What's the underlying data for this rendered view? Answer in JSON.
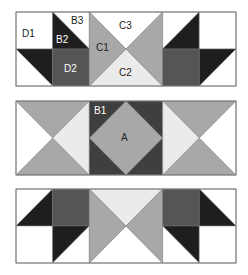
{
  "colors": {
    "white": "#ffffff",
    "black": "#1e1e1e",
    "dark": "#3f3f3f",
    "darkgray": "#555555",
    "mid": "#a8a8a8",
    "light": "#ebebeb",
    "stroke": "#777777"
  },
  "layout": {
    "strip_x": 16,
    "strip_width": 220,
    "strip_height": 74,
    "block_width": 73.33
  },
  "strips": [
    {
      "name": "top-strip",
      "y": 12,
      "blocks": [
        {
          "type": "cells",
          "cells": [
            {
              "pos": "tl",
              "kind": "solid",
              "fill": "white"
            },
            {
              "pos": "tr",
              "kind": "split-tlbr",
              "upper": "white",
              "lower": "black"
            },
            {
              "pos": "bl",
              "kind": "split-tlbr",
              "upper": "black",
              "lower": "white"
            },
            {
              "pos": "br",
              "kind": "solid",
              "fill": "darkgray"
            }
          ]
        },
        {
          "type": "hourglass",
          "top": "white",
          "bottom": "light",
          "left": "mid",
          "right": "mid"
        },
        {
          "type": "cells",
          "cells": [
            {
              "pos": "tl",
              "kind": "split-bltr",
              "upper": "white",
              "lower": "black"
            },
            {
              "pos": "tr",
              "kind": "solid",
              "fill": "white"
            },
            {
              "pos": "bl",
              "kind": "solid",
              "fill": "darkgray"
            },
            {
              "pos": "br",
              "kind": "split-bltr",
              "upper": "black",
              "lower": "white"
            }
          ]
        }
      ]
    },
    {
      "name": "middle-strip",
      "y": 101,
      "blocks": [
        {
          "type": "hourglass",
          "top": "mid",
          "bottom": "mid",
          "left": "white",
          "right": "light"
        },
        {
          "type": "diamond",
          "background": "dark",
          "diamond": "mid"
        },
        {
          "type": "hourglass",
          "top": "mid",
          "bottom": "mid",
          "left": "light",
          "right": "white"
        }
      ]
    },
    {
      "name": "bottom-strip",
      "y": 189,
      "blocks": [
        {
          "type": "cells",
          "cells": [
            {
              "pos": "tl",
              "kind": "split-bltr",
              "upper": "white",
              "lower": "black"
            },
            {
              "pos": "tr",
              "kind": "solid",
              "fill": "darkgray"
            },
            {
              "pos": "bl",
              "kind": "solid",
              "fill": "white"
            },
            {
              "pos": "br",
              "kind": "split-bltr",
              "upper": "black",
              "lower": "white"
            }
          ]
        },
        {
          "type": "hourglass",
          "top": "light",
          "bottom": "white",
          "left": "mid",
          "right": "mid"
        },
        {
          "type": "cells",
          "cells": [
            {
              "pos": "tl",
              "kind": "solid",
              "fill": "darkgray"
            },
            {
              "pos": "tr",
              "kind": "split-tlbr",
              "upper": "white",
              "lower": "black"
            },
            {
              "pos": "bl",
              "kind": "split-tlbr",
              "upper": "black",
              "lower": "white"
            },
            {
              "pos": "br",
              "kind": "solid",
              "fill": "white"
            }
          ]
        }
      ]
    }
  ],
  "labels": [
    {
      "id": "label-d1",
      "text": "D1",
      "x": 22,
      "y": 37,
      "color": "#222222"
    },
    {
      "id": "label-b3",
      "text": "B3",
      "x": 71,
      "y": 24,
      "color": "#222222"
    },
    {
      "id": "label-b2",
      "text": "B2",
      "x": 56,
      "y": 43,
      "color": "#ffffff"
    },
    {
      "id": "label-d2",
      "text": "D2",
      "x": 64,
      "y": 72,
      "color": "#ffffff"
    },
    {
      "id": "label-c1",
      "text": "C1",
      "x": 96,
      "y": 51,
      "color": "#222222"
    },
    {
      "id": "label-c3",
      "text": "C3",
      "x": 119,
      "y": 29,
      "color": "#222222"
    },
    {
      "id": "label-c2",
      "text": "C2",
      "x": 119,
      "y": 76,
      "color": "#222222"
    },
    {
      "id": "label-b1",
      "text": "B1",
      "x": 94,
      "y": 114,
      "color": "#ffffff"
    },
    {
      "id": "label-a",
      "text": "A",
      "x": 121,
      "y": 141,
      "color": "#222222"
    }
  ]
}
